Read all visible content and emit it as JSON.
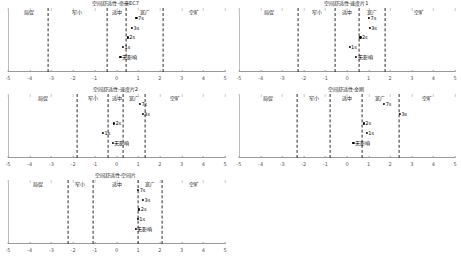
{
  "figure": {
    "axis": {
      "min": -5,
      "max": 5,
      "ticks": [
        -5,
        -4,
        -3,
        -2,
        -1,
        0,
        1,
        2,
        3,
        4,
        5
      ]
    },
    "zone_names": [
      "局促",
      "窄小",
      "适中",
      "宽广",
      "空旷"
    ],
    "point_names": [
      "无影响",
      "1s",
      "2s",
      "3s",
      "7s"
    ]
  },
  "chart_data": {
    "type": "scatter",
    "xlabel": "",
    "ylabel": "",
    "xlim": [
      -5,
      5
    ],
    "grid": false,
    "legend": "none",
    "xticks": [
      -5,
      -4,
      -3,
      -2,
      -1,
      0,
      1,
      2,
      3,
      4,
      5
    ],
    "xticklabels": [
      "-5",
      "-4",
      "-3",
      "-2",
      "-1",
      "0",
      "1",
      "2",
      "3",
      "4",
      "5"
    ],
    "zone_labels": [
      "局促",
      "窄小",
      "适中",
      "宽广",
      "空旷"
    ],
    "panels": [
      {
        "id": "panel-1",
        "title": "空间舒适性-帝豪EC7",
        "dividers": [
          -3.15,
          -0.45,
          0.45,
          2.15
        ],
        "zone_centers": [
          -4.05,
          -1.8,
          0.0,
          1.3,
          3.55
        ],
        "points": [
          {
            "label": "无影响",
            "x": 0.18,
            "level": 0
          },
          {
            "label": "1s",
            "x": 0.3,
            "level": 1
          },
          {
            "label": "2s",
            "x": 0.52,
            "level": 2
          },
          {
            "label": "3s",
            "x": 0.72,
            "level": 3
          },
          {
            "label": "7s",
            "x": 0.92,
            "level": 4
          }
        ]
      },
      {
        "id": "panel-2",
        "title": "空间舒适性-速度片1",
        "dividers": [
          -2.25,
          -0.55,
          0.55,
          1.75
        ],
        "zone_centers": [
          -3.6,
          -1.4,
          0.0,
          1.15,
          3.35
        ],
        "points": [
          {
            "label": "无影响",
            "x": 0.42,
            "level": 0
          },
          {
            "label": "1s",
            "x": 0.12,
            "level": 1
          },
          {
            "label": "2s",
            "x": 0.62,
            "level": 2
          },
          {
            "label": "3s",
            "x": 1.05,
            "level": 3
          },
          {
            "label": "7s",
            "x": 1.02,
            "level": 4
          }
        ]
      },
      {
        "id": "panel-3",
        "title": "空间舒适性-速度片2",
        "dividers": [
          -1.8,
          -0.4,
          0.3,
          1.3
        ],
        "zone_centers": [
          -3.4,
          -1.1,
          0.0,
          0.82,
          2.7
        ],
        "points": [
          {
            "label": "无影响",
            "x": -0.18,
            "level": 0
          },
          {
            "label": "1s",
            "x": -0.62,
            "level": 1
          },
          {
            "label": "2s",
            "x": -0.12,
            "level": 2
          },
          {
            "label": "3s",
            "x": 1.2,
            "level": 3
          },
          {
            "label": "7s",
            "x": 1.08,
            "level": 4
          }
        ]
      },
      {
        "id": "panel-4",
        "title": "空间舒适性-金刚",
        "dividers": [
          -2.3,
          -0.8,
          0.7,
          2.4
        ],
        "zone_centers": [
          -3.65,
          -1.55,
          0.0,
          1.55,
          3.7
        ],
        "points": [
          {
            "label": "无影响",
            "x": 0.3,
            "level": 0
          },
          {
            "label": "1s",
            "x": 0.92,
            "level": 1
          },
          {
            "label": "2s",
            "x": 0.78,
            "level": 2
          },
          {
            "label": "3s",
            "x": 2.45,
            "level": 3
          },
          {
            "label": "7s",
            "x": 1.72,
            "level": 4
          }
        ]
      },
      {
        "id": "panel-5",
        "title": "空间舒适性-空间片",
        "dividers": [
          -2.25,
          -1.1,
          1.0,
          2.1
        ],
        "zone_centers": [
          -3.6,
          -1.7,
          0.0,
          1.55,
          3.55
        ],
        "points": [
          {
            "label": "无影响",
            "x": 0.88,
            "level": 0
          },
          {
            "label": "1s",
            "x": 0.98,
            "level": 1
          },
          {
            "label": "2s",
            "x": 1.05,
            "level": 2
          },
          {
            "label": "3s",
            "x": 1.22,
            "level": 3
          },
          {
            "label": "7s",
            "x": 1.0,
            "level": 4
          }
        ]
      }
    ]
  }
}
